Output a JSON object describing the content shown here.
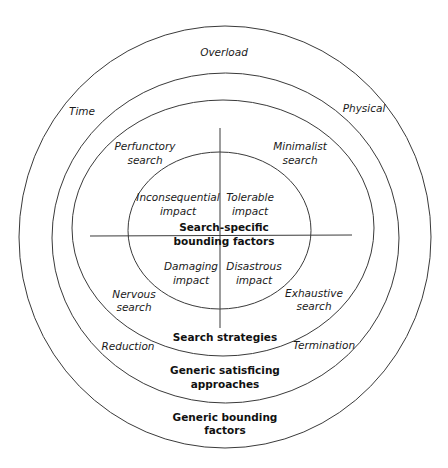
{
  "diagram": {
    "type": "concentric-ellipses",
    "layers": [
      {
        "id": "outer",
        "title": [
          "Generic bounding",
          "factors"
        ],
        "items": [
          "Overload",
          "Time",
          "Physical"
        ]
      },
      {
        "id": "second",
        "title": [
          "Generic satisficing",
          "approaches"
        ],
        "items": [
          "Reduction",
          "Termination"
        ]
      },
      {
        "id": "third",
        "title": [
          "Search strategies"
        ],
        "items": [
          [
            "Perfunctory",
            "search"
          ],
          [
            "Minimalist",
            "search"
          ],
          [
            "Nervous",
            "search"
          ],
          [
            "Exhaustive",
            "search"
          ]
        ]
      },
      {
        "id": "inner",
        "title": [
          "Search-specific",
          "bounding factors"
        ],
        "items": [
          [
            "Inconsequential",
            "impact"
          ],
          [
            "Tolerable",
            "impact"
          ],
          [
            "Damaging",
            "impact"
          ],
          [
            "Disastrous",
            "impact"
          ]
        ]
      }
    ]
  },
  "labels": {
    "overload": "Overload",
    "time": "Time",
    "physical": "Physical",
    "perfunctory_1": "Perfunctory",
    "perfunctory_2": "search",
    "minimalist_1": "Minimalist",
    "minimalist_2": "search",
    "inconsequential_1": "Inconsequential",
    "inconsequential_2": "impact",
    "tolerable_1": "Tolerable",
    "tolerable_2": "impact",
    "search_specific_1": "Search-specific",
    "search_specific_2": "bounding factors",
    "damaging_1": "Damaging",
    "damaging_2": "impact",
    "disastrous_1": "Disastrous",
    "disastrous_2": "impact",
    "nervous_1": "Nervous",
    "nervous_2": "search",
    "exhaustive_1": "Exhaustive",
    "exhaustive_2": "search",
    "search_strategies": "Search strategies",
    "reduction": "Reduction",
    "termination": "Termination",
    "satisficing_1": "Generic satisficing",
    "satisficing_2": "approaches",
    "generic_bounding_1": "Generic bounding",
    "generic_bounding_2": "factors"
  },
  "colors": {
    "stroke": "#3a3a3a",
    "text": "#1a1a1a",
    "background": "#ffffff"
  }
}
